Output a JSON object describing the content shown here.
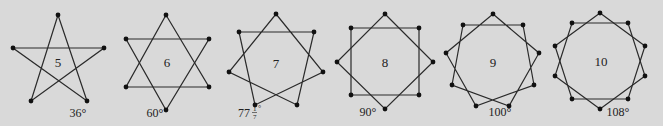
{
  "background": "#d9d9d9",
  "stroke_color": "#2a2a2a",
  "vertex_color": "#111111",
  "stars": [
    {
      "n": 5,
      "label": "5",
      "angle_label": "36°",
      "center": [
        58,
        62
      ],
      "label_pos": [
        58,
        67
      ],
      "angle_pos": [
        78,
        117
      ],
      "vertices": [
        [
          58,
          15
        ],
        [
          104,
          48
        ],
        [
          87,
          101
        ],
        [
          31,
          101
        ],
        [
          13,
          48
        ]
      ],
      "step": 2
    },
    {
      "n": 6,
      "label": "6",
      "angle_label": "60°",
      "center": [
        167,
        62
      ],
      "label_pos": [
        167,
        67
      ],
      "angle_pos": [
        155,
        117
      ],
      "triangles": [
        [
          [
            166,
            15
          ],
          [
            209,
            87
          ],
          [
            126,
            87
          ]
        ],
        [
          [
            126,
            39
          ],
          [
            209,
            39
          ],
          [
            166,
            110
          ]
        ]
      ]
    },
    {
      "n": 7,
      "label": "7",
      "angle_label_int": "77",
      "angle_label_num": "1",
      "angle_label_den": "7",
      "center": [
        276,
        63
      ],
      "label_pos": [
        276,
        68
      ],
      "angle_pos": [
        244,
        117
      ],
      "vertices": [
        [
          276,
          14
        ],
        [
          314,
          32
        ],
        [
          323,
          72
        ],
        [
          297,
          105
        ],
        [
          255,
          105
        ],
        [
          229,
          72
        ],
        [
          239,
          32
        ]
      ],
      "step": 2
    },
    {
      "n": 8,
      "label": "8",
      "angle_label": "90°",
      "center": [
        385,
        62
      ],
      "label_pos": [
        385,
        67
      ],
      "angle_pos": [
        368,
        116
      ],
      "squares": [
        [
          [
            385,
            14
          ],
          [
            433,
            62
          ],
          [
            385,
            109
          ],
          [
            337,
            62
          ]
        ],
        [
          [
            351,
            28
          ],
          [
            419,
            28
          ],
          [
            419,
            95
          ],
          [
            351,
            95
          ]
        ]
      ]
    },
    {
      "n": 9,
      "label": "9",
      "angle_label": "100°",
      "center": [
        493,
        62
      ],
      "label_pos": [
        493,
        67
      ],
      "angle_pos": [
        500,
        116
      ],
      "vertices": [
        [
          493,
          14
        ],
        [
          523,
          25
        ],
        [
          539,
          53
        ],
        [
          534,
          85
        ],
        [
          509,
          106
        ],
        [
          476,
          106
        ],
        [
          452,
          85
        ],
        [
          446,
          53
        ],
        [
          463,
          25
        ]
      ],
      "step": 2
    },
    {
      "n": 10,
      "label": "10",
      "angle_label": "108°",
      "center": [
        601,
        61
      ],
      "label_pos": [
        601,
        66
      ],
      "angle_pos": [
        618,
        116
      ],
      "pentagons": [
        [
          [
            600,
            13
          ],
          [
            645,
            46
          ],
          [
            628,
            99
          ],
          [
            572,
            99
          ],
          [
            555,
            46
          ]
        ],
        [
          [
            572,
            23
          ],
          [
            628,
            23
          ],
          [
            645,
            76
          ],
          [
            600,
            109
          ],
          [
            555,
            76
          ]
        ]
      ]
    }
  ]
}
